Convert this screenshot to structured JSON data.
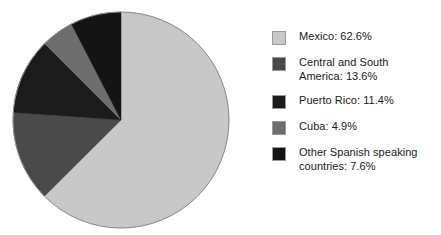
{
  "chart_data": {
    "type": "pie",
    "title": "",
    "categories": [
      "Mexico",
      "Central and South America",
      "Puerto Rico",
      "Cuba",
      "Other Spanish speaking countries"
    ],
    "values": [
      62.6,
      13.6,
      11.4,
      4.9,
      7.6
    ],
    "units": "percent",
    "start_angle_deg": 0,
    "direction": "clockwise",
    "legend_position": "right",
    "grid": false,
    "slices": [
      {
        "label": "Mexico",
        "value": 62.6,
        "value_text": "62.6%",
        "legend_text": "Mexico: 62.6%",
        "color": "#c8c8c8"
      },
      {
        "label": "Central and South America",
        "value": 13.6,
        "value_text": "13.6%",
        "legend_text": "Central and South\nAmerica: 13.6%",
        "color": "#4a4a4a"
      },
      {
        "label": "Puerto Rico",
        "value": 11.4,
        "value_text": "11.4%",
        "legend_text": "Puerto Rico: 11.4%",
        "color": "#1c1c1c"
      },
      {
        "label": "Cuba",
        "value": 4.9,
        "value_text": "4.9%",
        "legend_text": "Cuba: 4.9%",
        "color": "#6e6e6e"
      },
      {
        "label": "Other Spanish speaking countries",
        "value": 7.6,
        "value_text": "7.6%",
        "legend_text": "Other Spanish speaking\ncountries: 7.6%",
        "color": "#141414"
      }
    ]
  },
  "geometry": {
    "center_x": 121,
    "center_y": 120,
    "radius": 108,
    "outline_color": "#8c8c8c"
  }
}
